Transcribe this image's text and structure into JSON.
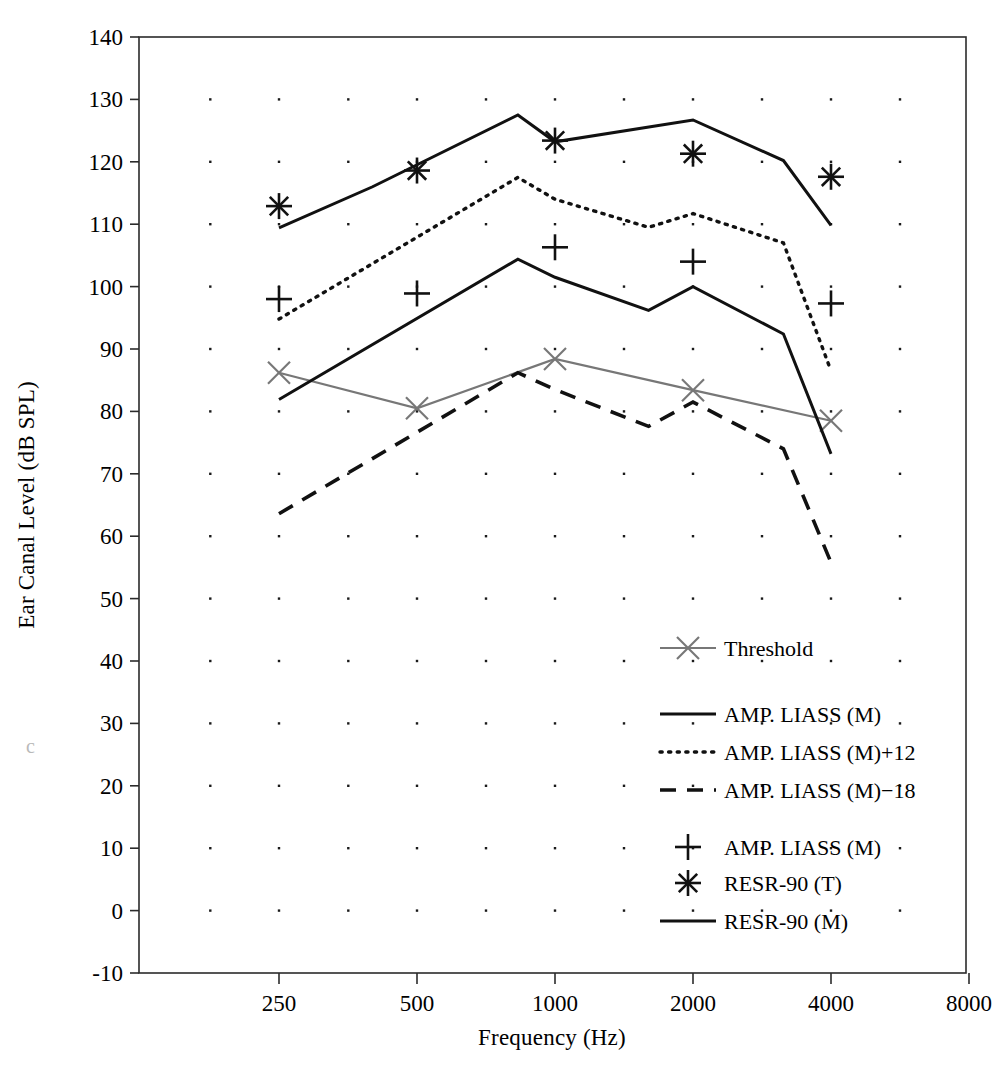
{
  "chart_data": {
    "type": "line",
    "title": "",
    "xlabel": "Frequency (Hz)",
    "ylabel": "Ear Canal Level (dB SPL)",
    "x_tick_labels": [
      "250",
      "500",
      "1000",
      "2000",
      "4000",
      "8000"
    ],
    "x_tick_values": [
      250,
      500,
      1000,
      2000,
      4000,
      8000
    ],
    "x_scale": "log",
    "xlim": [
      177,
      11314
    ],
    "y_tick_labels": [
      "-10",
      "0",
      "10",
      "20",
      "30",
      "40",
      "50",
      "60",
      "70",
      "80",
      "90",
      "100",
      "110",
      "120",
      "130",
      "140"
    ],
    "y_tick_values": [
      -10,
      0,
      10,
      20,
      30,
      40,
      50,
      60,
      70,
      80,
      90,
      100,
      110,
      120,
      130,
      140
    ],
    "ylim": [
      -10,
      140
    ],
    "grid": "dot-markers",
    "grid_color": "#1a1a1a",
    "legend_position": "inside-lower-right",
    "series": [
      {
        "name": "Threshold",
        "style": "solid",
        "color": "#777777",
        "marker": "x",
        "marker_color": "#777777",
        "x": [
          250,
          500,
          1000,
          2000,
          4000
        ],
        "values": [
          86.2,
          80.5,
          88.4,
          83.4,
          78.5
        ]
      },
      {
        "name": "AMP. LIASS (M)",
        "style": "solid",
        "color": "#111111",
        "marker": "none",
        "x": [
          250,
          830,
          1000,
          1600,
          2000,
          3150,
          4000
        ],
        "values": [
          81.9,
          104.4,
          101.5,
          96.2,
          100.0,
          92.4,
          73.2
        ]
      },
      {
        "name": "AMP. LIASS (M)+12",
        "style": "dotted",
        "color": "#111111",
        "marker": "none",
        "x": [
          250,
          830,
          1000,
          1600,
          2000,
          3150,
          4000
        ],
        "values": [
          94.8,
          117.5,
          114.0,
          109.5,
          111.7,
          107.0,
          86.5
        ]
      },
      {
        "name": "AMP. LIASS (M)−18",
        "style": "dashed",
        "color": "#111111",
        "marker": "none",
        "x": [
          250,
          830,
          1000,
          1600,
          2000,
          3150,
          4000
        ],
        "values": [
          63.6,
          86.2,
          83.5,
          77.6,
          81.5,
          74.0,
          55.8
        ]
      },
      {
        "name": "RESR-90 (M)",
        "style": "solid",
        "color": "#111111",
        "marker": "none",
        "x": [
          250,
          400,
          830,
          1000,
          2000,
          3150,
          4000
        ],
        "values": [
          109.4,
          116.0,
          127.5,
          123.2,
          126.7,
          120.2,
          109.8
        ]
      },
      {
        "name": "AMP. LIASS (M)",
        "style": "none",
        "color": "#111111",
        "marker": "plus",
        "x": [
          250,
          500,
          1000,
          2000,
          4000
        ],
        "values": [
          98.0,
          98.9,
          106.3,
          104.0,
          97.3
        ]
      },
      {
        "name": "RESR-90 (T)",
        "style": "none",
        "color": "#111111",
        "marker": "asterisk",
        "x": [
          250,
          500,
          1000,
          2000,
          4000
        ],
        "values": [
          112.9,
          118.6,
          123.4,
          121.3,
          117.6
        ]
      }
    ],
    "legend": [
      {
        "label": "Threshold",
        "style": "solid-gray-x",
        "marker": "x"
      },
      {
        "label": "AMP. LIASS (M)",
        "style": "solid",
        "marker": "none"
      },
      {
        "label": "AMP. LIASS (M)+12",
        "style": "dotted",
        "marker": "none"
      },
      {
        "label": "AMP. LIASS (M)−18",
        "style": "dashed",
        "marker": "none"
      },
      {
        "label": "AMP. LIASS (M)",
        "style": "none",
        "marker": "plus"
      },
      {
        "label": "RESR-90 (T)",
        "style": "none",
        "marker": "asterisk"
      },
      {
        "label": "RESR-90 (M)",
        "style": "solid",
        "marker": "none"
      }
    ]
  }
}
